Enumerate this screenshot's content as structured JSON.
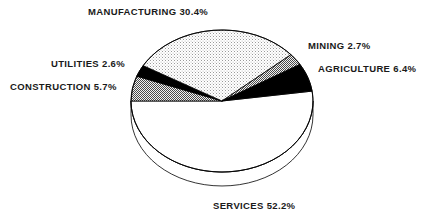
{
  "chart_data": {
    "type": "pie",
    "title": "",
    "subtitle": "",
    "xlabel": "",
    "ylabel": "",
    "legend_position": "none",
    "grid": false,
    "style": "3d-pie-with-depth",
    "value_unit": "percent",
    "total": 100.0,
    "categories": [
      "MANUFACTURING",
      "MINING",
      "AGRICULTURE",
      "SERVICES",
      "CONSTRUCTION",
      "UTILITIES"
    ],
    "values": [
      30.4,
      2.7,
      6.4,
      52.2,
      5.7,
      2.6
    ],
    "slices": [
      {
        "name": "construction",
        "label": "CONSTRUCTION 5.7%",
        "category": "CONSTRUCTION",
        "value": 5.7,
        "fill": "gray-dither",
        "color": "#808080",
        "start_angle": 180.0,
        "sweep": 20.5
      },
      {
        "name": "utilities",
        "label": "UTILITIES 2.6%",
        "category": "UTILITIES",
        "value": 2.6,
        "fill": "solid-black",
        "color": "#000000",
        "start_angle": 200.5,
        "sweep": 9.4
      },
      {
        "name": "manufacturing",
        "label": "MANUFACTURING 30.4%",
        "category": "MANUFACTURING",
        "value": 30.4,
        "fill": "light-dot-hatch",
        "color": "#d8d8d8",
        "start_angle": 209.9,
        "sweep": 109.4
      },
      {
        "name": "mining",
        "label": "MINING 2.7%",
        "category": "MINING",
        "value": 2.7,
        "fill": "gray-dither",
        "color": "#808080",
        "start_angle": 319.3,
        "sweep": 9.7
      },
      {
        "name": "agriculture",
        "label": "AGRICULTURE 6.4%",
        "category": "AGRICULTURE",
        "value": 6.4,
        "fill": "solid-black",
        "color": "#000000",
        "start_angle": 329.0,
        "sweep": 23.0
      },
      {
        "name": "services",
        "label": "SERVICES 52.2%",
        "category": "SERVICES",
        "value": 52.2,
        "fill": "white",
        "color": "#ffffff",
        "start_angle": 352.0,
        "sweep": 188.0
      }
    ]
  },
  "labels": {
    "manufacturing": "MANUFACTURING 30.4%",
    "mining": "MINING 2.7%",
    "agriculture": "AGRICULTURE 6.4%",
    "utilities": "UTILITIES 2.6%",
    "construction": "CONSTRUCTION 5.7%",
    "services": "SERVICES 52.2%"
  },
  "geometry": {
    "center_x": 222,
    "center_y": 101,
    "radius_x": 91,
    "radius_y": 71,
    "depth": 14
  },
  "colors": {
    "outline": "#000000",
    "black_slice": "#000000",
    "gray_slice": "#808080",
    "light_slice": "#d8d8d8",
    "white_slice": "#ffffff",
    "background": "#ffffff",
    "text": "#1a1a1a"
  }
}
